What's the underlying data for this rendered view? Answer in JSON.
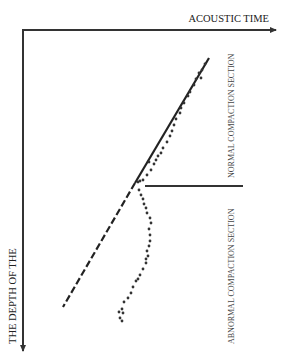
{
  "diagram": {
    "x_axis_label": "ACOUSTIC TIME",
    "y_axis_label": "THE DEPTH OF THE",
    "normal_section_label": "NORMAL COMPACTION SECTION",
    "abnormal_section_label": "ABNORMAL COMPACTION SECTION",
    "colors": {
      "axis": "#333333",
      "trend_line": "#222222",
      "points": "#333333",
      "text": "#222222"
    },
    "trend_line": {
      "solid": {
        "x1": 209,
        "y1": 58,
        "x2": 135,
        "y2": 183
      },
      "dashed": {
        "x1": 135,
        "y1": 183,
        "x2": 63,
        "y2": 307
      }
    },
    "separator": {
      "x1": 145,
      "y1": 186,
      "x2": 243,
      "y2": 186
    },
    "normal_points": [
      [
        205,
        64
      ],
      [
        202,
        70
      ],
      [
        199,
        73
      ],
      [
        201,
        78
      ],
      [
        196,
        79
      ],
      [
        194,
        85
      ],
      [
        190,
        92
      ],
      [
        188,
        96
      ],
      [
        184,
        103
      ],
      [
        181,
        108
      ],
      [
        180,
        113
      ],
      [
        176,
        119
      ],
      [
        174,
        125
      ],
      [
        172,
        131
      ],
      [
        170,
        136
      ],
      [
        167,
        142
      ],
      [
        163,
        148
      ],
      [
        161,
        153
      ],
      [
        158,
        156
      ],
      [
        156,
        160
      ],
      [
        154,
        164
      ],
      [
        149,
        162
      ],
      [
        151,
        170
      ],
      [
        147,
        175
      ],
      [
        143,
        180
      ],
      [
        140,
        181
      ],
      [
        138,
        182
      ]
    ],
    "abnormal_points": [
      [
        139,
        190
      ],
      [
        141,
        195
      ],
      [
        143,
        199
      ],
      [
        144,
        204
      ],
      [
        146,
        208
      ],
      [
        147,
        213
      ],
      [
        150,
        218
      ],
      [
        151,
        223
      ],
      [
        149,
        229
      ],
      [
        150,
        235
      ],
      [
        150,
        241
      ],
      [
        149,
        246
      ],
      [
        147,
        251
      ],
      [
        148,
        256
      ],
      [
        146,
        259
      ],
      [
        146,
        263
      ],
      [
        143,
        269
      ],
      [
        140,
        275
      ],
      [
        138,
        279
      ],
      [
        136,
        281
      ],
      [
        133,
        287
      ],
      [
        131,
        293
      ],
      [
        128,
        298
      ],
      [
        124,
        302
      ],
      [
        122,
        309
      ],
      [
        119,
        312
      ],
      [
        123,
        313
      ],
      [
        120,
        318
      ],
      [
        122,
        321
      ]
    ]
  }
}
